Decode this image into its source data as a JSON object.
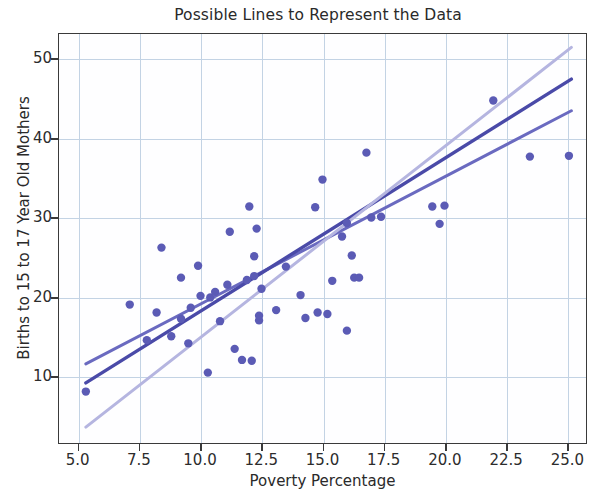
{
  "chart_data": {
    "type": "scatter",
    "title": "Possible Lines to Represent the Data",
    "xlabel": "Poverty Percentage",
    "ylabel": "Births to 15 to 17 Year Old Mothers",
    "xlim": [
      4.2,
      25.8
    ],
    "ylim": [
      1.5,
      53.2
    ],
    "xticks": [
      "5.0",
      "7.5",
      "10.0",
      "12.5",
      "15.0",
      "17.5",
      "20.0",
      "22.5",
      "25.0"
    ],
    "xtick_values": [
      5.0,
      7.5,
      10.0,
      12.5,
      15.0,
      17.5,
      20.0,
      22.5,
      25.0
    ],
    "yticks": [
      "10",
      "20",
      "30",
      "40",
      "50"
    ],
    "ytick_values": [
      10,
      20,
      30,
      40,
      50
    ],
    "grid": true,
    "legend": "none",
    "marker_color": "#5b5bb5",
    "points": [
      [
        5.3,
        8.0
      ],
      [
        7.1,
        19.0
      ],
      [
        7.8,
        14.5
      ],
      [
        8.2,
        18.0
      ],
      [
        8.4,
        26.2
      ],
      [
        8.8,
        15.0
      ],
      [
        9.2,
        17.2
      ],
      [
        9.2,
        22.4
      ],
      [
        9.5,
        14.1
      ],
      [
        9.6,
        18.6
      ],
      [
        9.9,
        23.9
      ],
      [
        10.0,
        20.1
      ],
      [
        10.3,
        10.4
      ],
      [
        10.4,
        19.9
      ],
      [
        10.6,
        20.6
      ],
      [
        10.8,
        16.9
      ],
      [
        11.1,
        21.5
      ],
      [
        11.2,
        28.2
      ],
      [
        11.4,
        13.4
      ],
      [
        11.7,
        12.0
      ],
      [
        11.9,
        22.1
      ],
      [
        12.0,
        31.4
      ],
      [
        12.1,
        11.9
      ],
      [
        12.2,
        22.6
      ],
      [
        12.2,
        25.1
      ],
      [
        12.3,
        28.6
      ],
      [
        12.4,
        17.0
      ],
      [
        12.4,
        17.6
      ],
      [
        12.5,
        21.0
      ],
      [
        13.1,
        18.3
      ],
      [
        13.5,
        23.8
      ],
      [
        14.1,
        20.2
      ],
      [
        14.3,
        17.3
      ],
      [
        14.7,
        31.3
      ],
      [
        14.8,
        18.0
      ],
      [
        15.0,
        34.8
      ],
      [
        15.2,
        17.8
      ],
      [
        15.4,
        22.0
      ],
      [
        15.8,
        27.6
      ],
      [
        16.0,
        29.3
      ],
      [
        16.0,
        15.7
      ],
      [
        16.2,
        25.2
      ],
      [
        16.3,
        22.4
      ],
      [
        16.5,
        22.4
      ],
      [
        16.8,
        38.2
      ],
      [
        17.0,
        30.0
      ],
      [
        17.4,
        30.1
      ],
      [
        19.5,
        31.4
      ],
      [
        19.8,
        29.2
      ],
      [
        20.0,
        31.5
      ],
      [
        22.0,
        44.8
      ],
      [
        23.5,
        37.7
      ],
      [
        25.1,
        37.8
      ]
    ],
    "lines": [
      {
        "name": "line-medium-slope",
        "color": "#6a6ac0",
        "width": 3.0,
        "opacity": 1.0,
        "x": [
          5.3,
          25.2
        ],
        "y": [
          11.5,
          43.5
        ],
        "slope": 1.61,
        "intercept": 2.98
      },
      {
        "name": "line-best-fit",
        "color": "#4a4aa8",
        "width": 3.4,
        "opacity": 1.0,
        "x": [
          5.3,
          25.2
        ],
        "y": [
          9.1,
          47.5
        ],
        "slope": 1.93,
        "intercept": -1.12
      },
      {
        "name": "line-steep-light",
        "color": "#b5b5e0",
        "width": 3.0,
        "opacity": 1.0,
        "x": [
          5.3,
          25.2
        ],
        "y": [
          3.5,
          51.5
        ],
        "slope": 2.41,
        "intercept": -9.28
      }
    ]
  },
  "colors": {
    "grid": "#c3d3e4",
    "axis": "#3a3a3a",
    "text": "#2a2a2a",
    "background": "#ffffff",
    "plot_background": "#fefeff"
  }
}
